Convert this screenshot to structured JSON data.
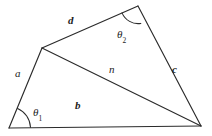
{
  "figure": {
    "background_color": "#ffffff",
    "stroke_color": "#2b2b2b",
    "width": 212,
    "height": 136,
    "vertices": [
      {
        "id": "A",
        "name": "bottom-left-vertex",
        "x": 9,
        "y": 128
      },
      {
        "id": "B",
        "name": "left-upper-vertex",
        "x": 42,
        "y": 48
      },
      {
        "id": "C",
        "name": "top-vertex",
        "x": 138,
        "y": 6
      },
      {
        "id": "D",
        "name": "right-vertex",
        "x": 201,
        "y": 126
      }
    ],
    "edges": [
      {
        "id": "a",
        "name": "edge-a",
        "from": "A",
        "to": "B",
        "label": "a",
        "style": "italic",
        "label_x": 15,
        "label_y": 68
      },
      {
        "id": "d",
        "name": "edge-d",
        "from": "B",
        "to": "C",
        "label": "d",
        "style": "bolditalic",
        "label_x": 68,
        "label_y": 15
      },
      {
        "id": "c",
        "name": "edge-c",
        "from": "C",
        "to": "D",
        "label": "c",
        "style": "bolditalic",
        "label_x": 172,
        "label_y": 64
      },
      {
        "id": "b",
        "name": "edge-b",
        "from": "A",
        "to": "D",
        "label": "b",
        "style": "bolditalic",
        "label_x": 75,
        "label_y": 100
      },
      {
        "id": "n",
        "name": "diagonal-n",
        "from": "B",
        "to": "D",
        "label": "n",
        "style": "italic",
        "label_x": 109,
        "label_y": 64
      }
    ],
    "angles": [
      {
        "id": "theta1",
        "name": "angle-theta-1",
        "at_vertex": "A",
        "symbol": "θ",
        "subscript": "1",
        "label_x": 33,
        "label_y": 107,
        "arc_path": "M 30.5 127.2 A 21.5 21.5 0 0 0 17.6 108.5"
      },
      {
        "id": "theta2",
        "name": "angle-theta-2",
        "at_vertex": "C",
        "symbol": "θ",
        "subscript": "2",
        "label_x": 117,
        "label_y": 29,
        "arc_path": "M 122.0 12.9 A 17.5 17.5 0 0 0 140.8 23.4"
      }
    ],
    "paths": {
      "outline": "M 9 128 L 42 48 L 138 6 L 201 126 Z",
      "diagonal": "M 42 48 L 201 126"
    }
  }
}
